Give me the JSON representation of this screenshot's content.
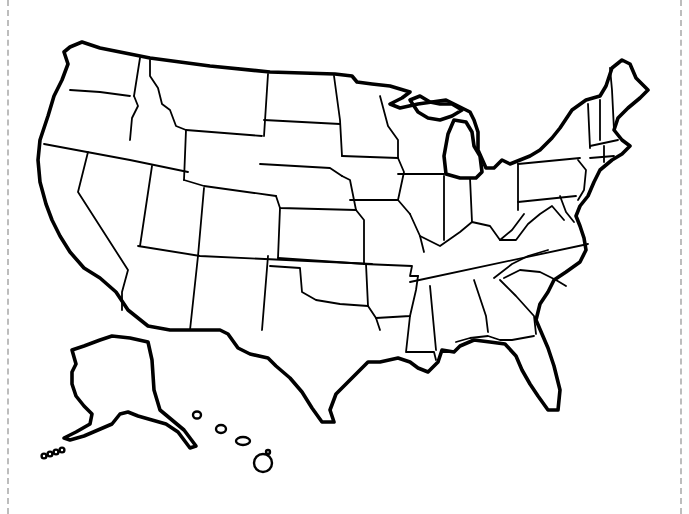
{
  "map": {
    "title": "",
    "subject": "Blank outline map of the United States",
    "colors": {
      "line": "#000000",
      "background": "#ffffff",
      "cut_line": "#bdbdbd"
    },
    "outlines": [
      {
        "name": "contiguous-us-outline",
        "d": "M70,47 L82,42 L100,48 L150,58 L210,66 L270,72 L335,74 L352,76 L357,82 L372,84 L390,86 L410,92 L402,98 L390,104 L400,108 L418,104 L432,102 L446,100 L458,106 L470,112 L474,120 L478,132 L478,150 L486,168 L494,168 L502,160 L510,164 L520,160 L530,156 L540,150 L552,138 L560,128 L572,110 L586,100 L600,96 L606,86 L612,68 L622,60 L630,64 L636,78 L648,90 L640,98 L628,108 L618,118 L614,130 L622,140 L630,146 L622,154 L612,160 L600,170 L594,182 L588,196 L580,206 L576,216 L580,226 L584,238 L586,250 L580,262 L566,272 L554,280 L548,292 L540,304 L536,320 L542,334 L548,348 L554,366 L560,390 L558,410 L548,410 L538,396 L530,384 L522,370 L516,356 L505,344 L490,342 L474,340 L460,346 L454,352 L442,350 L438,362 L428,372 L418,368 L410,362 L398,358 L380,362 L368,362 L356,374 L346,384 L336,394 L330,410 L334,422 L322,422 L312,408 L302,392 L290,378 L276,366 L268,358 L250,354 L238,348 L228,334 L220,330 L200,330 L170,330 L148,326 L128,310 L116,292 L100,278 L84,268 L70,252 L60,236 L52,220 L46,204 L40,182 L38,160 L40,140 L48,116 L54,96 L62,80 L68,64 L64,52 Z"
      },
      {
        "name": "michigan-upper-outline",
        "d": "M410,100 L420,96 L430,102 L440,104 L452,104 L462,110 L452,116 L440,120 L428,118 L418,112 Z"
      },
      {
        "name": "michigan-lower-outline",
        "d": "M446,174 L444,156 L448,134 L454,120 L466,122 L472,132 L474,146 L480,156 L482,172 L476,178 L460,178 Z"
      },
      {
        "name": "alaska-outline",
        "d": "M72,350 L84,346 L100,340 L112,336 L130,338 L148,342 L152,360 L154,390 L160,410 L172,420 L184,430 L196,446 L190,448 L178,432 L166,424 L152,420 L138,416 L128,412 L120,414 L112,424 L98,430 L84,436 L70,440 L64,438 L76,432 L90,424 L92,414 L84,406 L76,396 L72,384 L72,372 L76,364 Z"
      }
    ],
    "islands": [
      {
        "name": "aleutian-islands",
        "cx": [
          44,
          50,
          56,
          62
        ],
        "cy": [
          456,
          454,
          452,
          450
        ],
        "r": 2.4
      },
      {
        "name": "hawaii-kauai",
        "cx": 197,
        "cy": 415,
        "rx": 4,
        "ry": 3.5
      },
      {
        "name": "hawaii-oahu",
        "cx": 221,
        "cy": 429,
        "rx": 5,
        "ry": 4
      },
      {
        "name": "hawaii-maui",
        "cx": 243,
        "cy": 441,
        "rx": 7,
        "ry": 4
      },
      {
        "name": "hawaii-big-island",
        "cx": 263,
        "cy": 463,
        "rx": 9,
        "ry": 9
      },
      {
        "name": "hawaii-niihau",
        "cx": 268,
        "cy": 452,
        "rx": 2,
        "ry": 2
      }
    ],
    "borders": [
      {
        "name": "wa-or",
        "d": "M70,90 L100,92 L130,96"
      },
      {
        "name": "wa-id",
        "d": "M140,58 L134,96"
      },
      {
        "name": "or-id",
        "d": "M134,96 L138,106 L132,118 L130,140"
      },
      {
        "name": "or-ca-nv",
        "d": "M44,144 L130,160 L188,172"
      },
      {
        "name": "id-mt",
        "d": "M150,60 L150,76 L158,88 L162,104 L170,110 L176,126 L186,130"
      },
      {
        "name": "id-wy",
        "d": "M186,130 L184,180"
      },
      {
        "name": "ca-nv",
        "d": "M88,152 L78,192 L128,270 L122,292 L122,310"
      },
      {
        "name": "nv-ut",
        "d": "M152,166 L140,246"
      },
      {
        "name": "mt-wy",
        "d": "M186,130 L262,136"
      },
      {
        "name": "mt-dakotas",
        "d": "M268,74 L264,136"
      },
      {
        "name": "nd-sd",
        "d": "M264,120 L340,124"
      },
      {
        "name": "nd-mn",
        "d": "M334,76 L340,120 L342,156"
      },
      {
        "name": "sd-ne",
        "d": "M260,164 L330,168 L342,176"
      },
      {
        "name": "wy-ut-co",
        "d": "M184,180 L204,186 L276,196"
      },
      {
        "name": "ut-co",
        "d": "M204,188 L198,256"
      },
      {
        "name": "co-ne-ks",
        "d": "M276,196 L280,208 L356,210"
      },
      {
        "name": "co-east",
        "d": "M280,208 L278,258"
      },
      {
        "name": "az-nm-south",
        "d": "M138,246 L200,256 L372,264"
      },
      {
        "name": "az-nm",
        "d": "M198,256 L190,330"
      },
      {
        "name": "nm-tx",
        "d": "M268,256 L262,330"
      },
      {
        "name": "tx-ok",
        "d": "M270,266 L300,268 L302,292 L316,300 L340,304 L368,306"
      },
      {
        "name": "ok-ks",
        "d": "M278,258 L366,264"
      },
      {
        "name": "ok-ar-tx",
        "d": "M366,264 L368,306 L376,318 L380,330"
      },
      {
        "name": "ks-mo",
        "d": "M356,210 L364,220 L364,264"
      },
      {
        "name": "ne-ia-mo",
        "d": "M342,176 L350,180 L356,210"
      },
      {
        "name": "mn-ia",
        "d": "M342,156 L398,158"
      },
      {
        "name": "ia-mo",
        "d": "M350,200 L398,200"
      },
      {
        "name": "mn-wi",
        "d": "M380,96 L388,126 L398,140 L398,158"
      },
      {
        "name": "wi-il",
        "d": "M398,174 L444,174"
      },
      {
        "name": "ia-il",
        "d": "M398,158 L404,172 L398,200 L410,214"
      },
      {
        "name": "mo-il",
        "d": "M410,214 L420,236 L424,252"
      },
      {
        "name": "mo-ar",
        "d": "M364,264 L412,266 L410,276 L418,276"
      },
      {
        "name": "ar-la-ms",
        "d": "M376,318 L410,316 L416,290 L418,276"
      },
      {
        "name": "la-ms",
        "d": "M410,316 L406,352 L434,352 L436,360"
      },
      {
        "name": "il-in",
        "d": "M444,176 L444,240"
      },
      {
        "name": "in-oh",
        "d": "M470,178 L472,222"
      },
      {
        "name": "oh-pa",
        "d": "M518,164 L518,210"
      },
      {
        "name": "ny-pa",
        "d": "M518,164 L580,158"
      },
      {
        "name": "pa-south",
        "d": "M518,202 L576,196"
      },
      {
        "name": "ky-tn",
        "d": "M410,282 L588,244"
      },
      {
        "name": "ky-north",
        "d": "M420,236 L440,246 L460,232 L472,222 L490,226 L500,240 L512,230 L524,214"
      },
      {
        "name": "wv-va",
        "d": "M500,240 L516,240 L528,224 L540,214 L552,206 L564,220"
      },
      {
        "name": "tn-nc",
        "d": "M494,278 L512,264 L528,256 L548,250"
      },
      {
        "name": "ms-al",
        "d": "M430,286 L436,350"
      },
      {
        "name": "al-ga",
        "d": "M474,280 L486,316 L488,332"
      },
      {
        "name": "ga-fl-al",
        "d": "M456,342 L470,338 L488,336 L500,340 L512,340 L534,336"
      },
      {
        "name": "ga-sc",
        "d": "M500,280 L516,296 L534,316 L536,334"
      },
      {
        "name": "nc-sc",
        "d": "M504,278 L520,270 L540,272 L556,280 L566,286"
      },
      {
        "name": "vt-nh",
        "d": "M600,100 L600,140"
      },
      {
        "name": "ny-vt",
        "d": "M588,104 L590,148"
      },
      {
        "name": "ma-north",
        "d": "M590,146 L618,140"
      },
      {
        "name": "ma-ct-ri",
        "d": "M590,158 L614,156"
      },
      {
        "name": "ct-ri",
        "d": "M604,146 L604,162"
      },
      {
        "name": "nh-me",
        "d": "M610,68 L612,90 L614,130"
      },
      {
        "name": "nj",
        "d": "M578,160 L586,170 L584,190 L578,200"
      },
      {
        "name": "md-de",
        "d": "M560,196 L566,212 L574,222"
      }
    ]
  }
}
